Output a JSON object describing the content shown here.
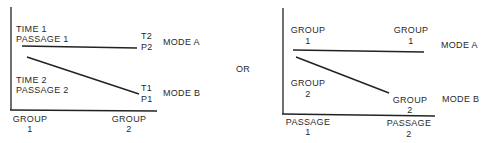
{
  "left_panel": {
    "labels": {
      "time1": "TIME 1",
      "passage1": "PASSAGE 1",
      "time2": "TIME 2",
      "passage2": "PASSAGE 2",
      "t2": "T2",
      "p2": "P2",
      "t1": "T1",
      "p1": "P1",
      "mode_a": "MODE A",
      "mode_b": "MODE B"
    },
    "x_ticks": [
      {
        "line1": "GROUP",
        "line2": "1"
      },
      {
        "line1": "GROUP",
        "line2": "2"
      }
    ]
  },
  "separator": "OR",
  "right_panel": {
    "labels": {
      "top_left_line1": "GROUP",
      "top_left_line2": "1",
      "top_right_line1": "GROUP",
      "top_right_line2": "1",
      "bottom_left_line1": "GROUP",
      "bottom_left_line2": "2",
      "bottom_right_line1": "GROUP",
      "bottom_right_line2": "2",
      "mode_a": "MODE A",
      "mode_b": "MODE B"
    },
    "x_ticks": [
      {
        "line1": "PASSAGE",
        "line2": "1"
      },
      {
        "line1": "PASSAGE",
        "line2": "2"
      }
    ]
  }
}
